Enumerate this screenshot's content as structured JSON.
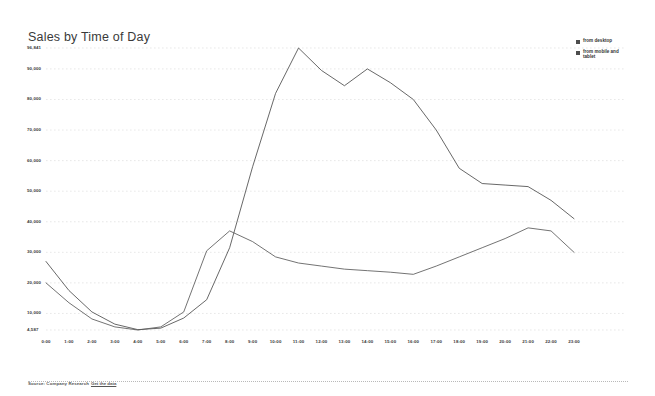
{
  "chart_title": "Sales by Time of Day",
  "legend": {
    "position": "top-right",
    "items": [
      {
        "label": "from desktop",
        "color": "#4d4d4d",
        "marker": "square-marker"
      },
      {
        "label": "from mobile and tablet",
        "color": "#4d4d4d",
        "marker": "square-marker"
      }
    ]
  },
  "footer": {
    "source_text": "Source: Company Research",
    "link_text": "Get the data"
  },
  "chart_data": {
    "type": "line",
    "title": "Sales by Time of Day",
    "xlabel": "",
    "ylabel": "",
    "grid": true,
    "legend_position": "top-right",
    "x": [
      "0:00",
      "1:00",
      "2:00",
      "3:00",
      "4:00",
      "5:00",
      "6:00",
      "7:00",
      "8:00",
      "9:00",
      "10:00",
      "11:00",
      "12:00",
      "13:00",
      "14:00",
      "15:00",
      "16:00",
      "17:00",
      "18:00",
      "19:00",
      "20:00",
      "21:00",
      "22:00",
      "23:00"
    ],
    "categories": [
      "0:00",
      "1:00",
      "2:00",
      "3:00",
      "4:00",
      "5:00",
      "6:00",
      "7:00",
      "8:00",
      "9:00",
      "10:00",
      "11:00",
      "12:00",
      "13:00",
      "14:00",
      "15:00",
      "16:00",
      "17:00",
      "18:00",
      "19:00",
      "20:00",
      "21:00",
      "22:00",
      "23:00"
    ],
    "ylim": [
      4587,
      96841
    ],
    "ytick_labels": [
      "96,841",
      "90,000",
      "80,000",
      "70,000",
      "60,000",
      "50,000",
      "40,000",
      "30,000",
      "20,000",
      "10,000",
      "4,587"
    ],
    "ytick_values": [
      96841,
      90000,
      80000,
      70000,
      60000,
      50000,
      40000,
      30000,
      20000,
      10000,
      4587
    ],
    "xtick_labels": [
      "0:00",
      "1:00",
      "2:00",
      "3:00",
      "4:00",
      "5:00",
      "6:00",
      "7:00",
      "8:00",
      "9:00",
      "10:00",
      "11:00",
      "12:00",
      "13:00",
      "14:00",
      "15:00",
      "16:00",
      "17:00",
      "18:00",
      "19:00",
      "20:00",
      "21:00",
      "22:00",
      "23:00"
    ],
    "series": [
      {
        "name": "from desktop",
        "color": "#4d4d4d",
        "values": [
          27000,
          17500,
          10500,
          6500,
          4700,
          5200,
          8500,
          14500,
          31500,
          58000,
          82000,
          96841,
          89500,
          84500,
          90000,
          85500,
          80000,
          70000,
          57500,
          52500,
          52000,
          51500,
          47000,
          41000
        ]
      },
      {
        "name": "from mobile and tablet",
        "color": "#5a5a5a",
        "values": [
          20000,
          13500,
          8200,
          5600,
          4587,
          5600,
          10500,
          30500,
          37000,
          33500,
          28500,
          26500,
          25500,
          24500,
          24000,
          23500,
          22800,
          25500,
          28500,
          31500,
          34500,
          38000,
          37000,
          30000
        ]
      }
    ]
  }
}
